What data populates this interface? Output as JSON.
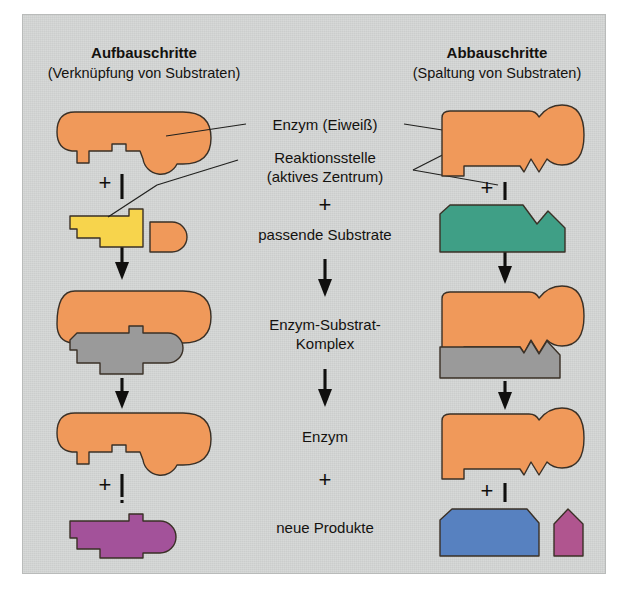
{
  "figure": {
    "title_left_main": "Aufbauschritte",
    "title_left_sub": "(Verknüpfung von Substraten)",
    "title_right_main": "Abbauschritte",
    "title_right_sub": "(Spaltung von Substraten)",
    "background_color": "#d5d7d6",
    "frame_color": "#ffffff"
  },
  "labels": {
    "enzyme": "Enzym (Eiweiß)",
    "active_site_line1": "Reaktionsstelle",
    "active_site_line2": "(aktives Zentrum)",
    "plus_1": "+",
    "substrates": "passende Substrate",
    "complex_line1": "Enzym-Substrat-",
    "complex_line2": "Komplex",
    "enzyme_again": "Enzym",
    "plus_2": "+",
    "products": "neue Produkte",
    "plus_left_1": "+",
    "plus_left_2": "+",
    "plus_right_1": "+",
    "plus_right_2": "+"
  },
  "colors": {
    "enzyme_orange": "#f0995a",
    "substrate_yellow": "#f7d44c",
    "substrate_green": "#3f9f86",
    "substrate_gray": "#9a9a9a",
    "product_purple": "#a3529a",
    "product_blue": "#5781c0",
    "product_small_purple": "#b0558f",
    "outline": "#3a3026",
    "text": "#14120f"
  },
  "left_column": {
    "step1_name": "Enzym mit Reaktionsstelle",
    "step2_substrates": [
      "gelbes Substrat",
      "oranges Substrat"
    ],
    "step3_name": "Enzym-Substrat-Komplex",
    "step4_name": "Enzym",
    "step5_product": "neues Produkt (violett)"
  },
  "right_column": {
    "step1_name": "Enzym mit Reaktionsstelle",
    "step2_substrate": "grünes Substrat",
    "step3_name": "Enzym-Substrat-Komplex",
    "step4_name": "Enzym",
    "step5_products": [
      "blaues Produkt",
      "violettes Produkt"
    ]
  }
}
